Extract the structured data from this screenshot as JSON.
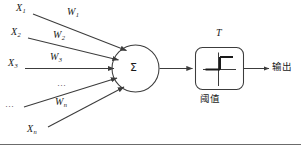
{
  "figure": {
    "type": "neuron-model-diagram",
    "stroke_color": "#3c3c3c",
    "text_color": "#1a1a1a",
    "background": "#ffffff",
    "width": 301,
    "height": 146
  },
  "inputs": [
    {
      "name": "input-x1",
      "base": "X",
      "sub": "1"
    },
    {
      "name": "input-x2",
      "base": "X",
      "sub": "2"
    },
    {
      "name": "input-x3",
      "base": "X",
      "sub": "3"
    },
    {
      "name": "input-ellipsis",
      "base": "…",
      "sub": ""
    },
    {
      "name": "input-xn",
      "base": "X",
      "sub": "n"
    }
  ],
  "weights": [
    {
      "name": "weight-w1",
      "base": "W",
      "sub": "1"
    },
    {
      "name": "weight-w2",
      "base": "W",
      "sub": "2"
    },
    {
      "name": "weight-w3",
      "base": "W",
      "sub": "3"
    },
    {
      "name": "weight-ellipsis",
      "base": "…",
      "sub": ""
    },
    {
      "name": "weight-wn",
      "base": "W",
      "sub": "n"
    }
  ],
  "summation": {
    "glyph": "Σ",
    "label": "summation-node"
  },
  "threshold": {
    "top_label": "T",
    "bottom_label": "阈值",
    "function": "step"
  },
  "output": {
    "label": "输出"
  }
}
